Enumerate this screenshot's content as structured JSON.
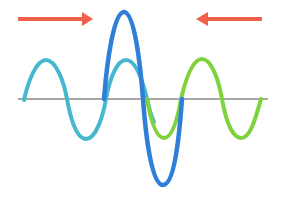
{
  "diagram": {
    "colors": {
      "background": "#ffffff",
      "axis": "#8a8a8a",
      "arrow": "#f0604a",
      "wave_left": "#45b8cf",
      "wave_right": "#7ed23e",
      "wave_combined": "#2f7fd8"
    },
    "baseline_y": 99,
    "arrows": [
      {
        "name": "arrow-right",
        "direction": "right",
        "x1": 18,
        "x2": 92,
        "y": 19
      },
      {
        "name": "arrow-left",
        "direction": "left",
        "x1": 262,
        "x2": 196,
        "y": 19
      }
    ],
    "waves": [
      {
        "name": "left-wave",
        "label": "Wave moving right",
        "amplitude": 40,
        "x_start": 25,
        "x_end": 148,
        "wavelength": 80
      },
      {
        "name": "right-wave",
        "label": "Wave moving left",
        "amplitude": 40,
        "x_start": 148,
        "x_end": 260,
        "wavelength": 78
      },
      {
        "name": "combined-wave",
        "label": "Superposition",
        "amplitude": 88,
        "x_start": 104,
        "x_end": 183,
        "wavelength": 79
      }
    ]
  }
}
